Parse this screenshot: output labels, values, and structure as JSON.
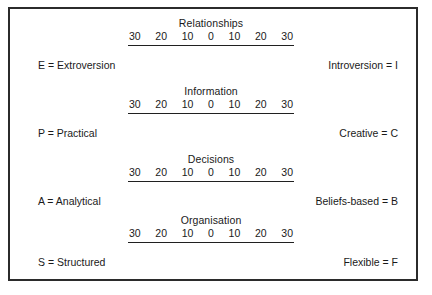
{
  "diagram": {
    "title_text": "",
    "scale_values": [
      "30",
      "20",
      "10",
      "0",
      "10",
      "20",
      "30"
    ],
    "border_color": "#2b2b2b",
    "text_color": "#1a1a1a",
    "sections": [
      {
        "title": "Relationships",
        "left_label": "E = Extroversion",
        "right_label": "Introversion = I",
        "ticks": [
          "30",
          "20",
          "10",
          "0",
          "10",
          "20",
          "30"
        ]
      },
      {
        "title": "Information",
        "left_label": "P = Practical",
        "right_label": "Creative = C",
        "ticks": [
          "30",
          "20",
          "10",
          "0",
          "10",
          "20",
          "30"
        ]
      },
      {
        "title": "Decisions",
        "left_label": "A = Analytical",
        "right_label": "Beliefs-based = B",
        "ticks": [
          "30",
          "20",
          "10",
          "0",
          "10",
          "20",
          "30"
        ]
      },
      {
        "title": "Organisation",
        "left_label": "S = Structured",
        "right_label": "Flexible = F",
        "ticks": [
          "30",
          "20",
          "10",
          "0",
          "10",
          "20",
          "30"
        ]
      }
    ]
  }
}
